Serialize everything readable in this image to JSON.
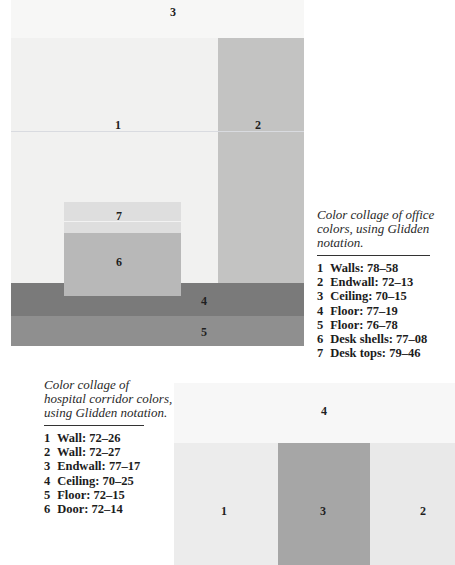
{
  "office": {
    "caption": "Color collage of office colors, using Glidden notation.",
    "swatch_numbers": {
      "walls": "1",
      "endwall": "2",
      "ceiling": "3",
      "floor_dark": "4",
      "floor": "5",
      "desk_shells": "6",
      "desk_tops": "7"
    },
    "colors": {
      "walls": "#f1f1f0",
      "endwall": "#c3c3c2",
      "ceiling": "#f7f7f6",
      "floor_dark": "#7a7a7a",
      "floor": "#8f8f8f",
      "desk_shells": "#b8b8b8",
      "desk_tops": "#dedede"
    },
    "legend": [
      {
        "num": "1",
        "text": "Walls: 78–58"
      },
      {
        "num": "2",
        "text": "Endwall: 72–13"
      },
      {
        "num": "3",
        "text": "Ceiling: 70–15"
      },
      {
        "num": "4",
        "text": "Floor: 77–19"
      },
      {
        "num": "5",
        "text": "Floor: 76–78"
      },
      {
        "num": "6",
        "text": "Desk shells: 77–08"
      },
      {
        "num": "7",
        "text": "Desk tops: 79–46"
      }
    ]
  },
  "hospital": {
    "caption": "Color collage of hospital corridor colors, using Glidden notation.",
    "swatch_numbers": {
      "wall_left": "1",
      "wall_right": "2",
      "endwall": "3",
      "ceiling": "4"
    },
    "colors": {
      "wall_left": "#ececec",
      "wall_right": "#e9e9e9",
      "endwall": "#a6a6a6",
      "ceiling": "#f7f7f7"
    },
    "legend": [
      {
        "num": "1",
        "text": "Wall: 72–26"
      },
      {
        "num": "2",
        "text": "Wall: 72–27"
      },
      {
        "num": "3",
        "text": "Endwall: 77–17"
      },
      {
        "num": "4",
        "text": "Ceiling: 70–25"
      },
      {
        "num": "5",
        "text": "Floor: 72–15"
      },
      {
        "num": "6",
        "text": "Door: 72–14"
      }
    ]
  }
}
